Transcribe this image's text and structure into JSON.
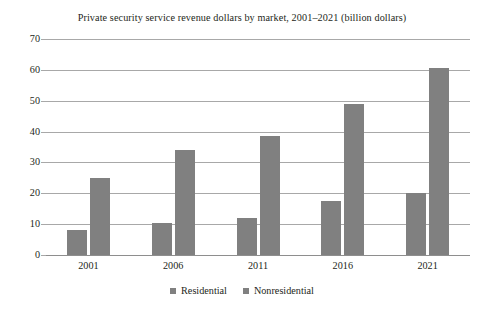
{
  "chart_data": {
    "type": "bar",
    "title": "Private security service revenue dollars by market, 2001–2021 (billion dollars)",
    "xlabel": "",
    "ylabel": "",
    "categories": [
      "2001",
      "2006",
      "2011",
      "2016",
      "2021"
    ],
    "series": [
      {
        "name": "Residential",
        "values": [
          8,
          10.5,
          12,
          17.5,
          20
        ],
        "color": "#808080"
      },
      {
        "name": "Nonresidential",
        "values": [
          25,
          34,
          38.5,
          49,
          60.5
        ],
        "color": "#808080"
      }
    ],
    "ylim": [
      0,
      70
    ],
    "yticks": [
      0,
      10,
      20,
      30,
      40,
      50,
      60,
      70
    ],
    "ytick_labels": [
      "0",
      "10",
      "20",
      "30",
      "40",
      "50",
      "60",
      "70"
    ],
    "grid": true,
    "grid_axis": "y",
    "legend_position": "bottom",
    "legend_entries": [
      "Residential",
      "Nonresidential"
    ],
    "background_color": "#ffffff",
    "gridline_color": "#a8a8a8",
    "text_color": "#231f20"
  }
}
